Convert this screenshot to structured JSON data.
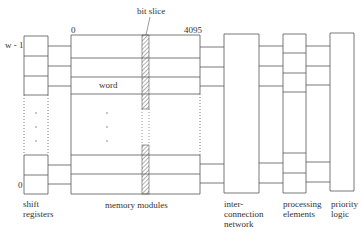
{
  "diagram": {
    "labels": {
      "bit_slice": "bit slice",
      "col_start": "0",
      "col_end": "4095",
      "row_top": "w - 1",
      "row_bottom": "0",
      "word": "word"
    },
    "components": [
      {
        "id": "shift-registers",
        "label": "shift\nregisters"
      },
      {
        "id": "memory-modules",
        "label": "memory modules"
      },
      {
        "id": "interconnection-network",
        "label": "inter-\nconnection\nnetwork"
      },
      {
        "id": "processing-elements",
        "label": "processing\nelements"
      },
      {
        "id": "priority-logic",
        "label": "priority\nlogic"
      }
    ],
    "colors": {
      "line": "#555555",
      "hatch": "#666666"
    }
  }
}
